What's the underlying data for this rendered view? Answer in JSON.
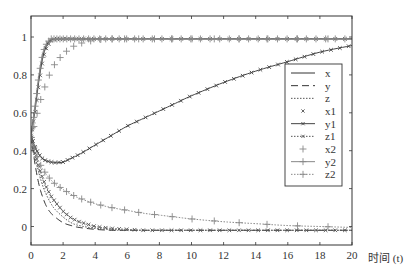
{
  "chart_data": {
    "type": "line",
    "title": "",
    "xlabel": "时间 (t)",
    "ylabel": "",
    "xlim": [
      0,
      20
    ],
    "ylim": [
      -0.1,
      1.1
    ],
    "xticks": [
      0,
      2,
      4,
      6,
      8,
      10,
      12,
      14,
      16,
      18,
      20
    ],
    "xtick_labels": [
      "0",
      "2",
      "4",
      "6",
      "8",
      "10",
      "12",
      "14",
      "16",
      "18",
      "20"
    ],
    "yticks": [
      0,
      0.2,
      0.4,
      0.6,
      0.8,
      1
    ],
    "ytick_labels": [
      "0",
      "0.2",
      "0.4",
      "0.6",
      "0.8",
      "1"
    ],
    "grid": false,
    "legend_position": "right-center inside",
    "x": [
      0,
      0.25,
      0.5,
      0.75,
      1,
      1.25,
      1.5,
      2,
      2.5,
      3,
      4,
      5,
      6,
      7,
      8,
      9,
      10,
      12,
      14,
      16,
      18,
      20
    ],
    "series": [
      {
        "name": "x",
        "style": "solid",
        "marker": "none",
        "color": "#333333",
        "values": [
          0.48,
          0.62,
          0.78,
          0.9,
          0.96,
          0.985,
          0.99,
          0.99,
          0.99,
          0.99,
          0.99,
          0.99,
          0.99,
          0.99,
          0.99,
          0.99,
          0.99,
          0.99,
          0.99,
          0.99,
          0.99,
          0.99
        ]
      },
      {
        "name": "y",
        "style": "dashed",
        "marker": "none",
        "color": "#333333",
        "values": [
          0.48,
          0.33,
          0.22,
          0.15,
          0.1,
          0.07,
          0.05,
          0.02,
          0.005,
          -0.005,
          -0.015,
          -0.02,
          -0.02,
          -0.02,
          -0.02,
          -0.02,
          -0.02,
          -0.02,
          -0.02,
          -0.02,
          -0.02,
          -0.02
        ]
      },
      {
        "name": "z",
        "style": "dotted",
        "marker": "none",
        "color": "#555555",
        "values": [
          0.48,
          0.37,
          0.28,
          0.21,
          0.16,
          0.12,
          0.09,
          0.05,
          0.02,
          0.005,
          -0.01,
          -0.015,
          -0.02,
          -0.02,
          -0.02,
          -0.02,
          -0.02,
          -0.02,
          -0.02,
          -0.02,
          -0.02,
          -0.02
        ]
      },
      {
        "name": "x1",
        "style": "none",
        "marker": "x",
        "color": "#555555",
        "values": [
          0.47,
          0.6,
          0.76,
          0.89,
          0.95,
          0.98,
          0.99,
          0.99,
          0.99,
          0.99,
          0.99,
          0.99,
          0.99,
          0.99,
          0.99,
          0.99,
          0.99,
          0.99,
          0.99,
          0.99,
          0.99,
          0.99
        ]
      },
      {
        "name": "y1",
        "style": "solid",
        "marker": "x",
        "color": "#444444",
        "values": [
          0.48,
          0.42,
          0.38,
          0.355,
          0.345,
          0.34,
          0.337,
          0.34,
          0.36,
          0.38,
          0.43,
          0.48,
          0.53,
          0.57,
          0.61,
          0.65,
          0.69,
          0.76,
          0.82,
          0.87,
          0.92,
          0.955
        ]
      },
      {
        "name": "z1",
        "style": "dotted",
        "marker": "x",
        "color": "#555555",
        "values": [
          0.47,
          0.39,
          0.31,
          0.25,
          0.2,
          0.16,
          0.13,
          0.08,
          0.045,
          0.025,
          0.0,
          -0.01,
          -0.015,
          -0.02,
          -0.02,
          -0.02,
          -0.02,
          -0.02,
          -0.02,
          -0.02,
          -0.02,
          -0.02
        ]
      },
      {
        "name": "x2",
        "style": "none",
        "marker": "+",
        "color": "#888888",
        "values": [
          0.47,
          0.55,
          0.64,
          0.71,
          0.77,
          0.82,
          0.86,
          0.91,
          0.945,
          0.965,
          0.985,
          0.99,
          0.99,
          0.99,
          0.99,
          0.99,
          0.99,
          0.99,
          0.99,
          0.99,
          0.99,
          0.99
        ]
      },
      {
        "name": "y2",
        "style": "solid",
        "marker": "+",
        "color": "#888888",
        "values": [
          0.47,
          0.63,
          0.8,
          0.92,
          0.97,
          0.99,
          0.99,
          0.99,
          0.99,
          0.99,
          0.99,
          0.99,
          0.99,
          0.99,
          0.99,
          0.99,
          0.99,
          0.99,
          0.99,
          0.99,
          0.99,
          0.99
        ]
      },
      {
        "name": "z2",
        "style": "dotted",
        "marker": "+",
        "color": "#888888",
        "values": [
          0.47,
          0.4,
          0.34,
          0.3,
          0.27,
          0.245,
          0.225,
          0.195,
          0.17,
          0.15,
          0.12,
          0.1,
          0.085,
          0.07,
          0.06,
          0.05,
          0.04,
          0.025,
          0.015,
          0.005,
          0.0,
          -0.005
        ]
      }
    ]
  },
  "axes_box": {
    "left": 31,
    "top": 16,
    "right": 352,
    "bottom": 245
  },
  "legend": {
    "box": {
      "left": 285,
      "top": 64,
      "right": 342,
      "bottom": 186
    },
    "entries": [
      "x",
      "y",
      "z",
      "x1",
      "y1",
      "z1",
      "x2",
      "y2",
      "z2"
    ]
  }
}
